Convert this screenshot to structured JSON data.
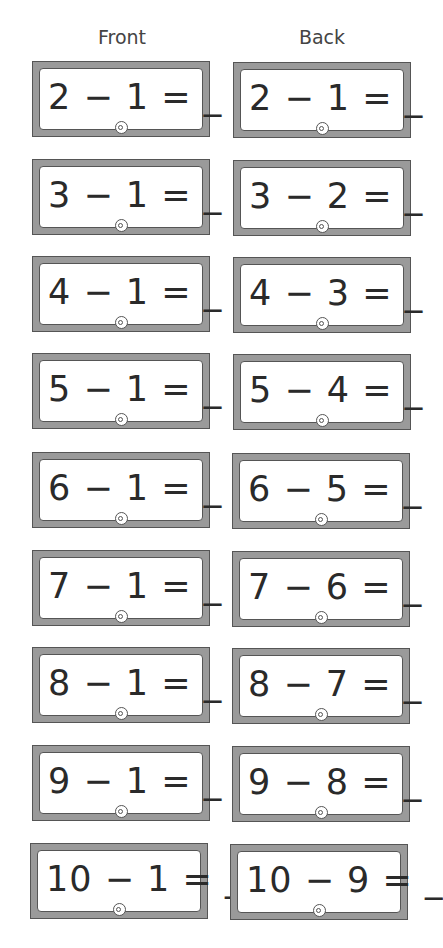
{
  "headers": {
    "front": "Front",
    "back": "Back"
  },
  "cards": {
    "front": [
      "2 − 1 = _",
      "3 − 1 = _",
      "4 − 1 = _",
      "5 − 1 = _",
      "6 − 1 = _",
      "7 − 1 = _",
      "8 − 1 = _",
      "9 − 1 = _",
      "10 − 1 = _"
    ],
    "back": [
      "2 − 1 = _",
      "3 − 2 = _",
      "4 − 3 = _",
      "5 − 4 = _",
      "6 − 5 = _",
      "7 − 6 = _",
      "8 − 7 = _",
      "9 − 8 = _",
      "10 − 9 = _"
    ]
  },
  "colors": {
    "frame": "#9a9a9a",
    "outline": "#555555",
    "text": "#2a2a2a"
  }
}
